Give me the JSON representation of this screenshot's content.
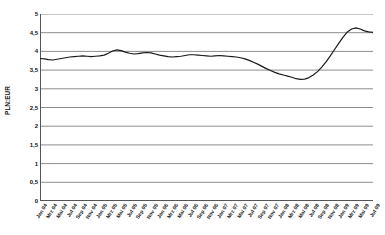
{
  "chart_data": {
    "type": "line",
    "title": "",
    "subtitle": "",
    "xlabel": "",
    "ylabel": "PLN:EUR",
    "ylim": [
      0,
      5
    ],
    "ytick_labels": [
      "5",
      "4,5",
      "4",
      "3,5",
      "3",
      "2,5",
      "2",
      "1,5",
      "1",
      "0,5",
      "0"
    ],
    "ytick_values": [
      5,
      4.5,
      4,
      3.5,
      3,
      2.5,
      2,
      1.5,
      1,
      0.5,
      0
    ],
    "grid": true,
    "grid_axis": "y",
    "legend": false,
    "legend_position": "none",
    "line_color": "#1a1a1a",
    "grid_color": "#808080",
    "axis_color": "#555555",
    "background": "#ffffff",
    "x": [
      "Jan 04",
      "Mrz 04",
      "Mai 04",
      "Jul 04",
      "Sep 04",
      "Nov 04",
      "Jan 05",
      "Mrz 05",
      "Mai 05",
      "Jul 05",
      "Sep 05",
      "Nov 05",
      "Jan 06",
      "Mrz 06",
      "Mai 06",
      "Jul 06",
      "Sep 06",
      "Nov 06",
      "Jan 07",
      "Mrz 07",
      "Mai 07",
      "Jul 07",
      "Sep 07",
      "Nov 07",
      "Jan 08",
      "Mrz 08",
      "Mai 08",
      "Jul 08",
      "Sep 08",
      "Nov 08",
      "Jan 09",
      "Mrz 09",
      "Mai 09",
      "Jul 09"
    ],
    "xtick_labels": [
      "Jan 04",
      "Mrz 04",
      "Mai 04",
      "Jul 04",
      "Sep 04",
      "Nov 04",
      "Jan 05",
      "Mrz 05",
      "Mai 05",
      "Jul 05",
      "Sep 05",
      "Nov 05",
      "Jan 06",
      "Mrz 06",
      "Mai 06",
      "Jul 06",
      "Sep 06",
      "Nov 06",
      "Jan 07",
      "Mrz 07",
      "Mai 07",
      "Jul 07",
      "Sep 07",
      "Nov 07",
      "Jan 08",
      "Mrz 08",
      "Mai 08",
      "Jul 08",
      "Sep 08",
      "Nov 08",
      "Jan 09",
      "Mrz 09",
      "Mai 09",
      "Jul 09"
    ],
    "series": [
      {
        "name": "PLN:EUR",
        "values": [
          3.8,
          3.78,
          3.81,
          3.86,
          3.88,
          3.87,
          3.88,
          3.92,
          4.03,
          3.97,
          3.93,
          3.95,
          3.97,
          3.92,
          3.87,
          3.85,
          3.86,
          3.88,
          3.91,
          3.89,
          3.88,
          3.87,
          3.88,
          3.86,
          3.82,
          3.7,
          3.55,
          3.42,
          3.35,
          3.26,
          3.3,
          3.55,
          3.95,
          4.38
        ]
      }
    ],
    "dense_values": [
      3.81,
      3.8,
      3.78,
      3.77,
      3.79,
      3.81,
      3.83,
      3.85,
      3.86,
      3.87,
      3.88,
      3.87,
      3.86,
      3.87,
      3.88,
      3.9,
      3.95,
      4.01,
      4.04,
      4.02,
      3.98,
      3.95,
      3.93,
      3.94,
      3.96,
      3.97,
      3.96,
      3.93,
      3.9,
      3.88,
      3.86,
      3.85,
      3.86,
      3.87,
      3.89,
      3.91,
      3.91,
      3.9,
      3.89,
      3.88,
      3.87,
      3.88,
      3.89,
      3.88,
      3.87,
      3.86,
      3.85,
      3.83,
      3.8,
      3.76,
      3.71,
      3.66,
      3.6,
      3.54,
      3.49,
      3.44,
      3.4,
      3.37,
      3.34,
      3.31,
      3.27,
      3.25,
      3.26,
      3.3,
      3.37,
      3.46,
      3.58,
      3.72,
      3.88,
      4.05,
      4.22,
      4.38,
      4.52,
      4.6,
      4.63,
      4.6,
      4.55,
      4.52,
      4.51
    ],
    "annotations": []
  }
}
